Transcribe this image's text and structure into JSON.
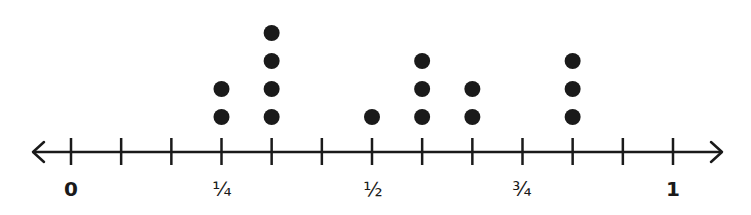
{
  "chart_data": {
    "type": "dot_plot",
    "title": "",
    "xlabel": "",
    "ylabel": "",
    "xlim": [
      0,
      1
    ],
    "tick_step": "1/12",
    "ticks": [
      0,
      0.0833,
      0.1667,
      0.25,
      0.3333,
      0.4167,
      0.5,
      0.5833,
      0.6667,
      0.75,
      0.8333,
      0.9167,
      1
    ],
    "tick_labels": [
      {
        "value": 0,
        "label": "0"
      },
      {
        "value": 0.25,
        "label": "¼"
      },
      {
        "value": 0.5,
        "label": "½"
      },
      {
        "value": 0.75,
        "label": "¾"
      },
      {
        "value": 1,
        "label": "1"
      }
    ],
    "points": [
      {
        "x": "3/12",
        "value": 0.25,
        "count": 2
      },
      {
        "x": "4/12",
        "value": 0.3333,
        "count": 4
      },
      {
        "x": "6/12",
        "value": 0.5,
        "count": 1
      },
      {
        "x": "7/12",
        "value": 0.5833,
        "count": 3
      },
      {
        "x": "8/12",
        "value": 0.6667,
        "count": 2
      },
      {
        "x": "10/12",
        "value": 0.8333,
        "count": 3
      }
    ],
    "axis_arrows": "both",
    "grid": false
  },
  "colors": {
    "ink": "#1a1a1a",
    "background": "#ffffff"
  },
  "labels": {
    "zero": "0",
    "quarter": "¼",
    "half": "½",
    "three_quarters": "¾",
    "one": "1"
  }
}
